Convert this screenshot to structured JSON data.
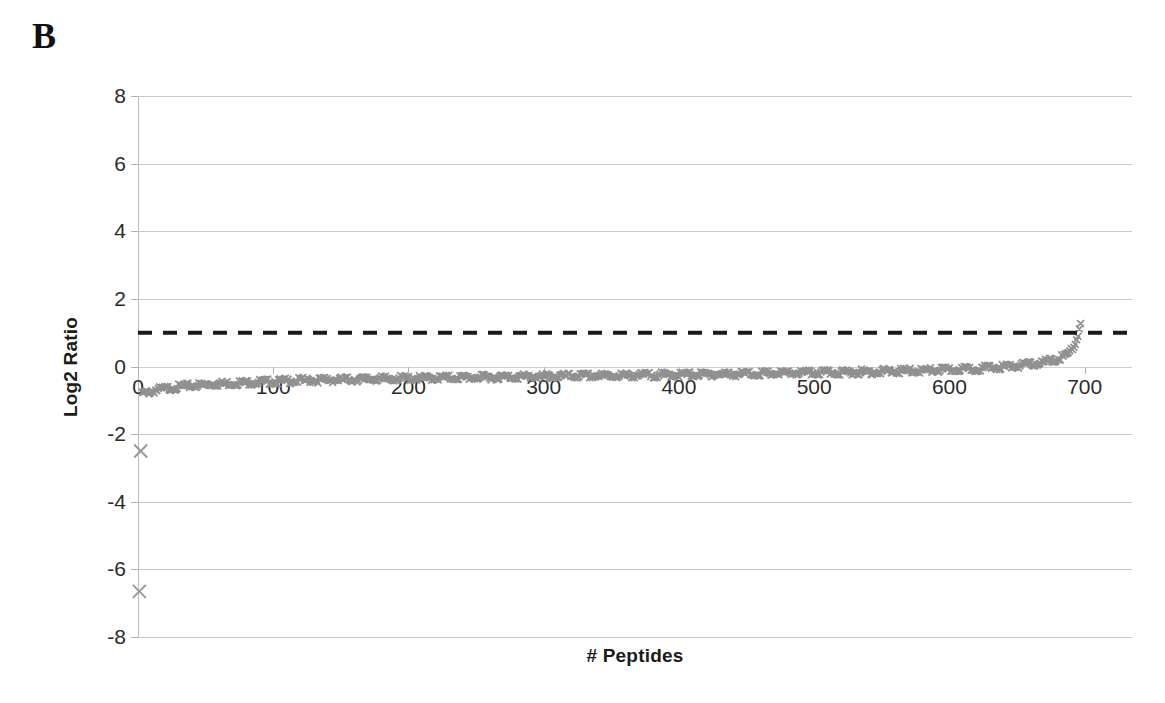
{
  "panel": {
    "label": "B"
  },
  "axes": {
    "y_title": "Log2 Ratio",
    "x_title": "# Peptides",
    "y_ticks": [
      "8",
      "6",
      "4",
      "2",
      "0",
      "-2",
      "-4",
      "-6",
      "-8"
    ],
    "x_ticks": [
      "0",
      "100",
      "200",
      "300",
      "400",
      "500",
      "600",
      "700"
    ]
  },
  "chart_data": {
    "type": "scatter",
    "title": "",
    "subtitle": "",
    "xlabel": "# Peptides",
    "ylabel": "Log2 Ratio",
    "xlim": [
      0,
      735
    ],
    "ylim": [
      -8,
      8
    ],
    "xticks": [
      0,
      100,
      200,
      300,
      400,
      500,
      600,
      700
    ],
    "yticks": [
      -8,
      -6,
      -4,
      -2,
      0,
      2,
      4,
      6,
      8
    ],
    "grid": true,
    "grid_axis": "y",
    "legend": false,
    "marker": "x",
    "marker_color": "#909090",
    "series": [
      {
        "name": "Log2 ratio per peptide (rank-ordered)",
        "marker": "x",
        "color": "#909090",
        "description": "Rank-ordered peptide log2 ratios forming a dense monotonically increasing band from about -0.75 at rank 1 to about +1.4 at rank 697, plus two low outliers near rank 1-3.",
        "points": [
          [
            1,
            -6.65
          ],
          [
            2,
            -2.5
          ],
          [
            3,
            -0.76
          ],
          [
            5,
            -0.74
          ],
          [
            8,
            -0.71
          ],
          [
            12,
            -0.67
          ],
          [
            17,
            -0.63
          ],
          [
            23,
            -0.6
          ],
          [
            30,
            -0.56
          ],
          [
            38,
            -0.53
          ],
          [
            47,
            -0.5
          ],
          [
            57,
            -0.47
          ],
          [
            68,
            -0.45
          ],
          [
            80,
            -0.43
          ],
          [
            93,
            -0.41
          ],
          [
            107,
            -0.39
          ],
          [
            122,
            -0.37
          ],
          [
            138,
            -0.355
          ],
          [
            155,
            -0.34
          ],
          [
            173,
            -0.325
          ],
          [
            192,
            -0.31
          ],
          [
            212,
            -0.3
          ],
          [
            233,
            -0.285
          ],
          [
            255,
            -0.275
          ],
          [
            278,
            -0.26
          ],
          [
            302,
            -0.25
          ],
          [
            327,
            -0.235
          ],
          [
            353,
            -0.225
          ],
          [
            380,
            -0.21
          ],
          [
            408,
            -0.195
          ],
          [
            437,
            -0.18
          ],
          [
            467,
            -0.165
          ],
          [
            497,
            -0.145
          ],
          [
            527,
            -0.125
          ],
          [
            557,
            -0.1
          ],
          [
            587,
            -0.07
          ],
          [
            612,
            -0.035
          ],
          [
            632,
            0.01
          ],
          [
            648,
            0.06
          ],
          [
            660,
            0.11
          ],
          [
            670,
            0.17
          ],
          [
            678,
            0.24
          ],
          [
            684,
            0.33
          ],
          [
            688,
            0.43
          ],
          [
            691,
            0.58
          ],
          [
            693,
            0.75
          ],
          [
            695,
            0.95
          ],
          [
            696,
            1.15
          ],
          [
            697,
            1.35
          ]
        ]
      }
    ],
    "annotations": [
      {
        "type": "hline",
        "name": "threshold-line",
        "y": 1.0,
        "style": "dashed",
        "color": "#1a1a1a",
        "label": ""
      }
    ],
    "outliers": [
      {
        "x": 1,
        "y": -6.65
      },
      {
        "x": 2,
        "y": -2.5
      }
    ]
  }
}
